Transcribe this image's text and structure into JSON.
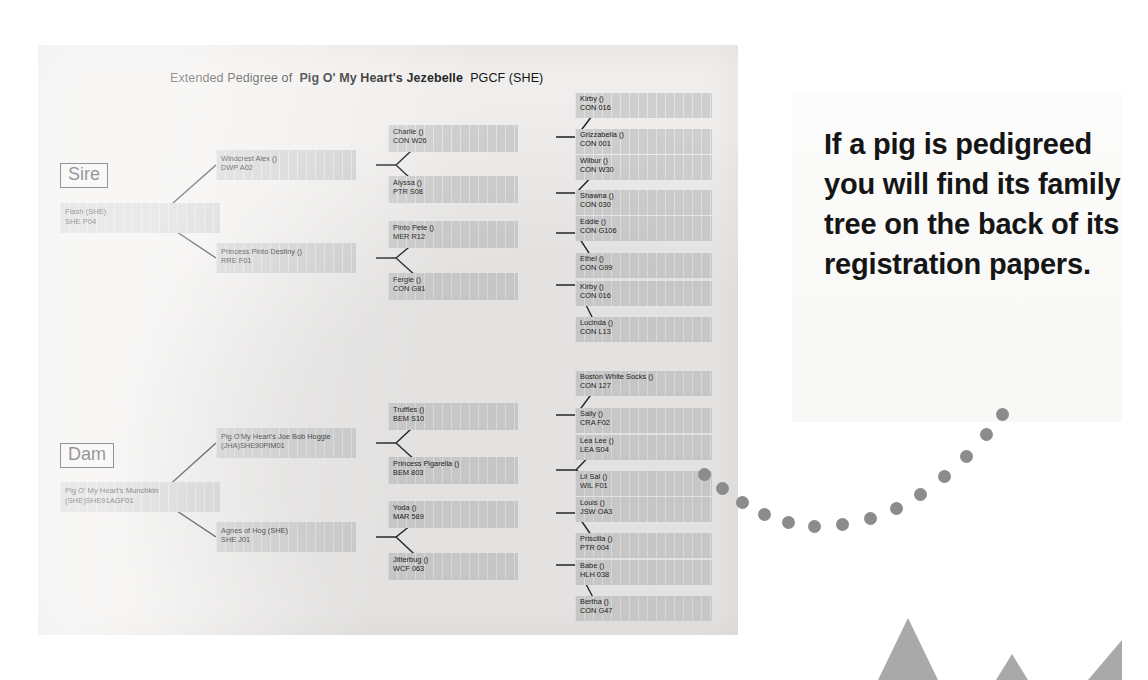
{
  "title": {
    "prefix": "Extended Pedigree of",
    "animal": "Pig O' My Heart's Jezebelle",
    "suffix": "PGCF (SHE)"
  },
  "labels": {
    "sire": "Sire",
    "dam": "Dam"
  },
  "caption": "If a pig is pedigreed you will find its family tree on the back of its registration papers.",
  "colors": {
    "node_fill": "#cfcfcf",
    "line": "#1d1d1d",
    "dot": "#8c8c8c",
    "paper": "#f0eeec"
  },
  "sire": {
    "root": {
      "l1": "Flash (SHE)",
      "l2": "SHE P04"
    },
    "gen2": [
      {
        "l1": "Windcrest  Alex ()",
        "l2": "DWP A02"
      },
      {
        "l1": "Princess Pinto Destiny ()",
        "l2": "RRE F01"
      }
    ],
    "gen3": [
      {
        "l1": "Charlie ()",
        "l2": "CON W26"
      },
      {
        "l1": "Alyssa ()",
        "l2": "PTR S08"
      },
      {
        "l1": "Pinto Pete ()",
        "l2": "MER R12"
      },
      {
        "l1": "Fergie ()",
        "l2": "CON G81"
      }
    ],
    "gen4": [
      {
        "l1": "Kirby ()",
        "l2": "CON 016"
      },
      {
        "l1": "Grizzabella ()",
        "l2": "CON 001"
      },
      {
        "l1": "Wilbur ()",
        "l2": "CON W30"
      },
      {
        "l1": "Shawna ()",
        "l2": "CON 030"
      },
      {
        "l1": "Eddie ()",
        "l2": "CON G106"
      },
      {
        "l1": "Ethel ()",
        "l2": "CON G99"
      },
      {
        "l1": "Kirby ()",
        "l2": "CON 016"
      },
      {
        "l1": "Lucinda ()",
        "l2": "CON L13"
      }
    ]
  },
  "dam": {
    "root": {
      "l1": "Pig O' My Heart's Munchkin",
      "l2": "(SHE)SHE91AGF01"
    },
    "gen2": [
      {
        "l1": "Pig O'My Heart's Joe Bob Hoggie",
        "l2": "(JHA)SHE90PIM01"
      },
      {
        "l1": "Agnes of Hog (SHE)",
        "l2": "SHE J01"
      }
    ],
    "gen3": [
      {
        "l1": "Truffles ()",
        "l2": "BEM S10"
      },
      {
        "l1": "Princess Pigarella ()",
        "l2": "BEM 803"
      },
      {
        "l1": "Yoda ()",
        "l2": "MAR 589"
      },
      {
        "l1": "Jitterbug ()",
        "l2": "WCF 063"
      }
    ],
    "gen4": [
      {
        "l1": "Boston White Socks ()",
        "l2": "CON 127"
      },
      {
        "l1": "Sally ()",
        "l2": "CRA F02"
      },
      {
        "l1": "Lea Lee ()",
        "l2": "LEA S04"
      },
      {
        "l1": "Lil Sal ()",
        "l2": "WIL F01"
      },
      {
        "l1": "Louis ()",
        "l2": "JSW OA3"
      },
      {
        "l1": "Priscilla ()",
        "l2": "PTR 004"
      },
      {
        "l1": "Babe ()",
        "l2": "HLH 038"
      },
      {
        "l1": "Bertha ()",
        "l2": "CON G47"
      }
    ]
  }
}
